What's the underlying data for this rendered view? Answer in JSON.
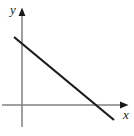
{
  "figure": {
    "kind": "line-plot",
    "width": 134,
    "height": 136,
    "background_color": "#ffffff"
  },
  "axes": {
    "x_axis": {
      "label": "x",
      "color": "#808080",
      "stroke_width": 1.5,
      "start": [
        2,
        105
      ],
      "end": [
        128,
        105
      ],
      "arrow": "right",
      "arrow_color": "#1a1a1a"
    },
    "y_axis": {
      "label": "y",
      "color": "#808080",
      "stroke_width": 1.5,
      "start": [
        22,
        127
      ],
      "end": [
        22,
        8
      ],
      "arrow": "up",
      "arrow_color": "#1a1a1a"
    },
    "origin": [
      22,
      105
    ]
  },
  "chart_data": {
    "type": "line",
    "title": "",
    "xlabel": "x",
    "ylabel": "y",
    "grid": false,
    "legend": null,
    "series": [
      {
        "name": "line",
        "color": "#1a1a1a",
        "stroke_width": 2.2,
        "description": "straight line with negative slope",
        "pixel_points": [
          [
            14,
            37
          ],
          [
            114,
            120
          ]
        ],
        "slope": -0.83,
        "y_intercept_pixel": [
          22,
          43
        ],
        "x_intercept_pixel": [
          97,
          105
        ]
      }
    ]
  }
}
